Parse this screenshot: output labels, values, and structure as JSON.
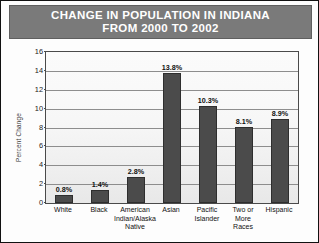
{
  "chart_data": {
    "type": "bar",
    "title": "CHANGE IN POPULATION IN INDIANA FROM 2000 TO 2002",
    "title_lines": [
      "CHANGE IN POPULATION IN INDIANA",
      "FROM 2000 TO 2002"
    ],
    "xlabel": "",
    "ylabel": "Percent Change",
    "ylim": [
      0,
      16
    ],
    "ytick_values": [
      0,
      2,
      4,
      6,
      8,
      10,
      12,
      14,
      16
    ],
    "ytick_labels": [
      "0",
      "2",
      "4",
      "6",
      "8",
      "10",
      "12",
      "14",
      "16"
    ],
    "grid": true,
    "legend": false,
    "categories": [
      "White",
      "American Indian/Alaska Native",
      "Black",
      "Asian",
      "Pacific Islander",
      "Two or More Races",
      "Hispanic"
    ],
    "category_labels": [
      "White",
      "Black",
      "American Indian/Alaska\nNative",
      "Asian",
      "Pacific\nIslander",
      "Two or\nMore\nRaces",
      "Hispanic"
    ],
    "values": [
      0.8,
      1.4,
      2.8,
      13.8,
      10.3,
      8.1,
      8.9
    ],
    "value_labels": [
      "0.8%",
      "1.4%",
      "2.8%",
      "13.8%",
      "10.3%",
      "8.1%",
      "8.9%"
    ],
    "colors": {
      "bar_fill": "#4b4b4b",
      "bar_edge": "#2e2e2e",
      "title_banner": "#7a7a7a",
      "title_text": "#ffffff",
      "plot_background": "#f7f7f7",
      "gridline": "#8d8d8d",
      "axis": "#4a4a4a",
      "figure_border": "#111111"
    }
  }
}
